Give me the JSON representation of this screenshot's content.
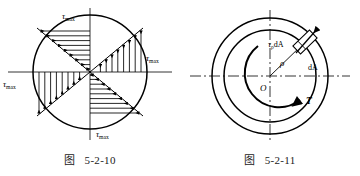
{
  "page": {
    "background_color": "#ffffff",
    "ink_color": "#000000",
    "width": 360,
    "height": 176
  },
  "figures": [
    {
      "id": "fig-5-2-10",
      "caption_label": "图",
      "caption_number": "5-2-10",
      "description": "Circular cross-section with linear torsional shear stress distribution on two perpendicular diameters",
      "labels": {
        "tau_top": "τ",
        "tau_top_sub": "max",
        "tau_right": "τ",
        "tau_right_sub": "max",
        "tau_left": "τ",
        "tau_left_sub": "max",
        "tau_bottom": "τ",
        "tau_bottom_sub": "max"
      },
      "geometry": {
        "center_x": 90,
        "center_y": 72,
        "radius": 57,
        "inclined_line_angle_deg": 22
      }
    },
    {
      "id": "fig-5-2-11",
      "caption_label": "图",
      "caption_number": "5-2-11",
      "description": "Annular shaft cross-section showing elemental area dA at radius rho carrying shear force tau-rho dA, with applied torque T",
      "labels": {
        "shear_force": "τ",
        "shear_force_sub": "ρ",
        "shear_force_tail": "dA",
        "radius": "ρ",
        "element_area": "dA",
        "center": "O",
        "torque": "T"
      },
      "geometry": {
        "center_x": 90,
        "center_y": 76,
        "outer_radius": 58,
        "inner_radius": 46,
        "element_angle_deg": 52,
        "torque_arc_radius": 30
      }
    }
  ]
}
